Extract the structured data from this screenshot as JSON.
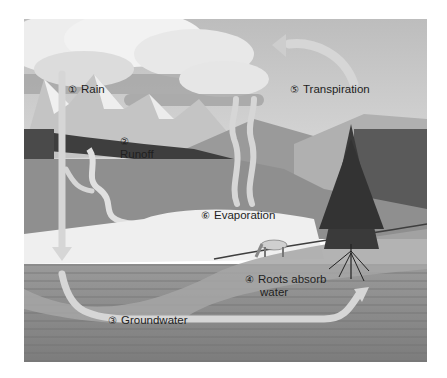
{
  "diagram": {
    "type": "water-cycle-illustration",
    "colors": {
      "sky": "#cfcfcf",
      "cloud": "#ececec",
      "cloud_shadow": "#9a9a9a",
      "mountain": "#b8b8b8",
      "forest": "#4a4a4a",
      "hill": "#8e8e8e",
      "lake": "#eeeeee",
      "ground": "#8a8a8a",
      "arrow": "#d6d6d6",
      "text": "#1e1e1e"
    },
    "labels": [
      {
        "id": "rain",
        "number": "①",
        "text": "Rain"
      },
      {
        "id": "runoff",
        "number": "②",
        "text": "Runoff"
      },
      {
        "id": "groundwater",
        "number": "③",
        "text": "Groundwater"
      },
      {
        "id": "roots",
        "number": "④",
        "text": "Roots absorb",
        "text2": "water"
      },
      {
        "id": "transpiration",
        "number": "⑤",
        "text": "Transpiration"
      },
      {
        "id": "evaporation",
        "number": "⑥",
        "text": "Evaporation"
      }
    ]
  }
}
